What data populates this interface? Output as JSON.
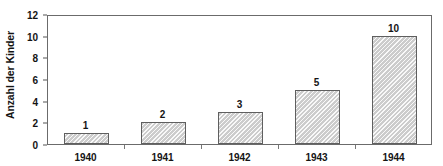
{
  "chart_data": {
    "type": "bar",
    "title": "",
    "xlabel": "",
    "ylabel": "Anzahl der Kinder",
    "categories": [
      "1940",
      "1941",
      "1942",
      "1943",
      "1944"
    ],
    "values": [
      1,
      2,
      3,
      5,
      10
    ],
    "value_labels": [
      "1",
      "2",
      "3",
      "5",
      "10"
    ],
    "ylim": [
      0,
      12
    ],
    "yticks": [
      0,
      2,
      4,
      6,
      8,
      10,
      12
    ],
    "ytick_labels": [
      "0",
      "2",
      "4",
      "6",
      "8",
      "10",
      "12"
    ],
    "grid": false,
    "legend": false,
    "series": [
      {
        "name": "Anzahl der Kinder",
        "values": [
          1,
          2,
          3,
          5,
          10
        ]
      }
    ]
  },
  "style": {
    "bar_fill": "#d9d9d9",
    "bar_border": "#5f5f5f",
    "axis_color": "#6b6b6b",
    "text_color": "#141414",
    "background": "#ffffff"
  }
}
